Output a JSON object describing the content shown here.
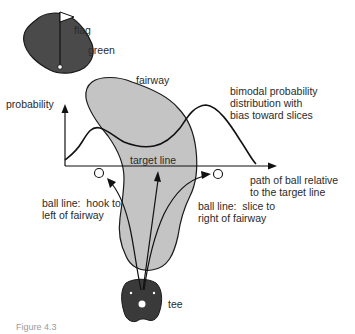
{
  "figure": {
    "labels": {
      "flag": "flag",
      "green": "green",
      "fairway": "fairway",
      "probability": "probability",
      "distribution": "bimodal probability\ndistribution with\nbias toward slices",
      "target_line": "target line",
      "path": "path of ball relative\nto the target line",
      "hook": "ball line:  hook to\nleft of fairway",
      "slice": "ball line:  slice to\nright of fairway",
      "tee": "tee"
    },
    "caption_partial": "Figure 4.3",
    "colors": {
      "green_fill": "#4a4a4a",
      "tee_fill": "#3a3a3a",
      "fairway_fill": "#c4c4c4",
      "stroke": "#1a1a1a",
      "background": "#ffffff"
    }
  }
}
